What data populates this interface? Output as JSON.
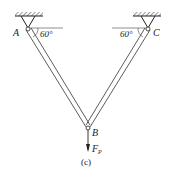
{
  "diagram": {
    "labels": {
      "A": "A",
      "B": "B",
      "C": "C",
      "force": "F",
      "force_sub": "P"
    },
    "angles": {
      "left": "60°",
      "right": "60°"
    },
    "caption": "(c)"
  }
}
